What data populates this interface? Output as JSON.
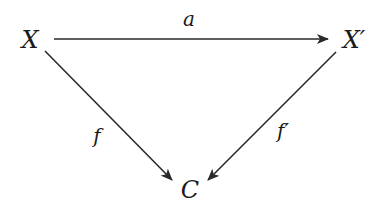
{
  "diagram": {
    "type": "commutative-triangle",
    "colors": {
      "stroke": "#2a2a2a",
      "text": "#1a1a1a",
      "background": "#ffffff"
    },
    "nodes": {
      "X": {
        "label": "X",
        "x": 30,
        "y": 40
      },
      "Xp": {
        "label": "X′",
        "x": 354,
        "y": 40
      },
      "C": {
        "label": "C",
        "x": 190,
        "y": 190
      }
    },
    "arrows": {
      "a": {
        "label": "a",
        "from": "X",
        "to": "X′",
        "label_x": 189,
        "label_y": 19
      },
      "f": {
        "label": "f",
        "from": "X",
        "to": "C",
        "label_x": 97,
        "label_y": 136
      },
      "fp": {
        "label": "f′",
        "from": "X′",
        "to": "C",
        "label_x": 283,
        "label_y": 131
      }
    }
  }
}
